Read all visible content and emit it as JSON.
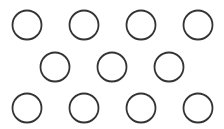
{
  "diagram": {
    "stroke_color": "#333333",
    "fill_color": "#ffffff",
    "radius": 14.5,
    "stroke_width": 1.8,
    "rows": [
      {
        "y": 25,
        "x": [
          27,
          84,
          141,
          198
        ]
      },
      {
        "y": 67,
        "x": [
          55,
          112,
          169
        ]
      },
      {
        "y": 108,
        "x": [
          27,
          84,
          141,
          198
        ]
      }
    ]
  }
}
